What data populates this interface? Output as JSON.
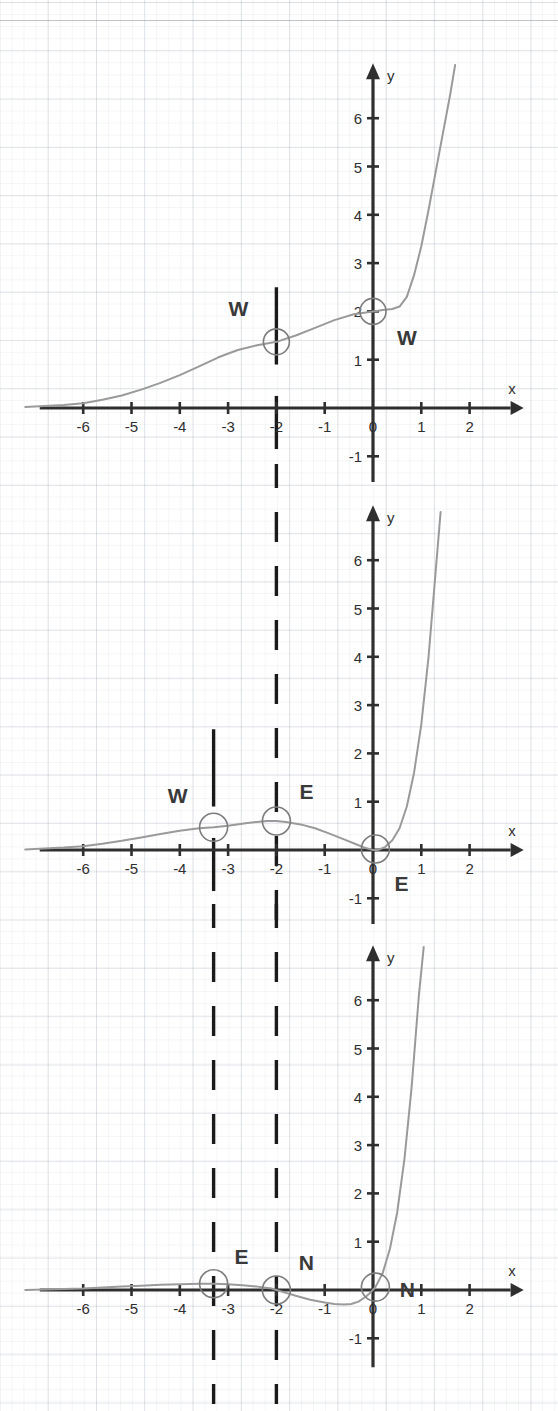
{
  "page": {
    "title_fragment_cropped": "",
    "background": "#ffffff",
    "ink_color": "#2f2f2f",
    "curve_color": "#9a9a9a",
    "panel_count": 3
  },
  "chart_data": [
    {
      "id": "panel-1",
      "type": "line",
      "title": "",
      "xlabel": "x",
      "ylabel": "y",
      "xlim": [
        -7.2,
        2.7
      ],
      "ylim": [
        -1.6,
        7.2
      ],
      "xticks": [
        -6,
        -5,
        -4,
        -3,
        -2,
        -1,
        0,
        1,
        2
      ],
      "yticks": [
        -1,
        1,
        2,
        3,
        4,
        5,
        6
      ],
      "xtick_labels": [
        "-6",
        "-5",
        "-4",
        "-3",
        "-2",
        "-1",
        "0",
        "1",
        "2"
      ],
      "ytick_labels": [
        "-1",
        "1",
        "2",
        "3",
        "4",
        "5",
        "6"
      ],
      "grid": true,
      "legend": "none",
      "series": [
        {
          "name": "curve-1",
          "x": [
            -7.2,
            -6.8,
            -6.4,
            -6.0,
            -5.6,
            -5.2,
            -4.8,
            -4.4,
            -4.0,
            -3.6,
            -3.2,
            -2.8,
            -2.4,
            -2.0,
            -1.6,
            -1.2,
            -0.8,
            -0.4,
            0.0,
            0.2,
            0.4,
            0.55,
            0.7,
            0.85,
            1.0,
            1.15,
            1.3,
            1.45,
            1.6,
            1.7
          ],
          "y": [
            0.02,
            0.04,
            0.06,
            0.1,
            0.17,
            0.26,
            0.38,
            0.52,
            0.68,
            0.86,
            1.05,
            1.2,
            1.3,
            1.37,
            1.5,
            1.66,
            1.82,
            1.94,
            2.0,
            2.03,
            2.05,
            2.1,
            2.3,
            2.75,
            3.35,
            4.1,
            4.9,
            5.7,
            6.5,
            7.1
          ]
        }
      ],
      "markers": [
        {
          "label": "W",
          "x": -2.0,
          "y": 1.37,
          "label_dx": -38,
          "label_dy": -26,
          "circle_r": 13
        },
        {
          "label": "W",
          "x": 0.0,
          "y": 2.0,
          "label_dx": 34,
          "label_dy": 34,
          "circle_r": 13
        }
      ],
      "dashed_verticals": [
        {
          "x": -2.0,
          "style": "solid-segment"
        }
      ]
    },
    {
      "id": "panel-2",
      "type": "line",
      "title": "",
      "xlabel": "x",
      "ylabel": "y",
      "xlim": [
        -7.2,
        2.7
      ],
      "ylim": [
        -1.6,
        7.2
      ],
      "xticks": [
        -6,
        -5,
        -4,
        -3,
        -2,
        -1,
        0,
        1,
        2
      ],
      "yticks": [
        -1,
        1,
        2,
        3,
        4,
        5,
        6
      ],
      "xtick_labels": [
        "-6",
        "-5",
        "-4",
        "-3",
        "-2",
        "-1",
        "0",
        "1",
        "2"
      ],
      "ytick_labels": [
        "-1",
        "1",
        "2",
        "3",
        "4",
        "5",
        "6"
      ],
      "grid": true,
      "legend": "none",
      "series": [
        {
          "name": "curve-2",
          "x": [
            -7.2,
            -6.8,
            -6.4,
            -6.0,
            -5.6,
            -5.2,
            -4.8,
            -4.4,
            -4.0,
            -3.6,
            -3.3,
            -3.0,
            -2.6,
            -2.2,
            -2.0,
            -1.8,
            -1.5,
            -1.2,
            -0.9,
            -0.6,
            -0.35,
            -0.15,
            0.0,
            0.1,
            0.25,
            0.4,
            0.55,
            0.7,
            0.85,
            1.0,
            1.15,
            1.3,
            1.4
          ],
          "y": [
            0.01,
            0.03,
            0.05,
            0.08,
            0.13,
            0.19,
            0.26,
            0.33,
            0.4,
            0.45,
            0.47,
            0.5,
            0.56,
            0.6,
            0.6,
            0.58,
            0.53,
            0.45,
            0.34,
            0.22,
            0.12,
            0.04,
            0.0,
            0.0,
            0.06,
            0.2,
            0.45,
            0.9,
            1.6,
            2.6,
            4.0,
            5.8,
            7.0
          ]
        }
      ],
      "markers": [
        {
          "label": "W",
          "x": -3.3,
          "y": 0.47,
          "label_dx": -36,
          "label_dy": -24,
          "circle_r": 14
        },
        {
          "label": "E",
          "x": -2.0,
          "y": 0.6,
          "label_dx": 30,
          "label_dy": -22,
          "circle_r": 14
        },
        {
          "label": "E",
          "x": 0.05,
          "y": 0.02,
          "label_dx": 26,
          "label_dy": 42,
          "circle_r": 14
        }
      ],
      "dashed_verticals": [
        {
          "x": -2.0,
          "style": "dashed"
        },
        {
          "x": -3.3,
          "style": "solid-segment"
        }
      ]
    },
    {
      "id": "panel-3",
      "type": "line",
      "title": "",
      "xlabel": "x",
      "ylabel": "y",
      "xlim": [
        -7.2,
        2.7
      ],
      "ylim": [
        -1.6,
        7.2
      ],
      "xticks": [
        -6,
        -5,
        -4,
        -3,
        -2,
        -1,
        0,
        1,
        2
      ],
      "yticks": [
        -1,
        1,
        2,
        3,
        4,
        5,
        6
      ],
      "xtick_labels": [
        "-6",
        "-5",
        "-4",
        "-3",
        "-2",
        "-1",
        "0",
        "1",
        "2"
      ],
      "ytick_labels": [
        "-1",
        "1",
        "2",
        "3",
        "4",
        "5",
        "6"
      ],
      "grid": true,
      "legend": "none",
      "series": [
        {
          "name": "curve-3",
          "x": [
            -7.2,
            -6.8,
            -6.4,
            -6.0,
            -5.6,
            -5.2,
            -4.8,
            -4.4,
            -4.0,
            -3.6,
            -3.3,
            -3.0,
            -2.7,
            -2.4,
            -2.1,
            -2.0,
            -1.8,
            -1.6,
            -1.3,
            -1.0,
            -0.8,
            -0.6,
            -0.45,
            -0.3,
            -0.15,
            -0.05,
            0.05,
            0.2,
            0.35,
            0.5,
            0.65,
            0.8,
            0.95,
            1.05
          ],
          "y": [
            0.0,
            0.01,
            0.02,
            0.03,
            0.05,
            0.07,
            0.09,
            0.11,
            0.12,
            0.13,
            0.13,
            0.12,
            0.1,
            0.07,
            0.03,
            0.0,
            -0.06,
            -0.12,
            -0.2,
            -0.26,
            -0.29,
            -0.3,
            -0.29,
            -0.24,
            -0.14,
            -0.05,
            0.06,
            0.35,
            0.85,
            1.6,
            2.7,
            4.2,
            6.1,
            7.1
          ]
        }
      ],
      "markers": [
        {
          "label": "E",
          "x": -3.3,
          "y": 0.13,
          "label_dx": 28,
          "label_dy": -20,
          "circle_r": 14
        },
        {
          "label": "N",
          "x": -2.0,
          "y": 0.0,
          "label_dx": 30,
          "label_dy": -20,
          "circle_r": 14
        },
        {
          "label": "N",
          "x": 0.05,
          "y": 0.06,
          "label_dx": 32,
          "label_dy": 10,
          "circle_r": 14
        }
      ],
      "dashed_verticals": [
        {
          "x": -2.0,
          "style": "dashed"
        },
        {
          "x": -3.3,
          "style": "dashed"
        }
      ]
    }
  ]
}
